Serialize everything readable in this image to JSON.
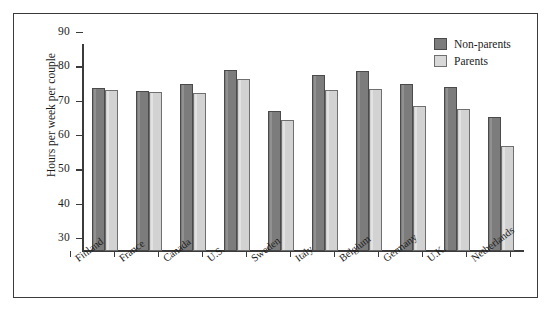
{
  "chart_data": {
    "type": "bar",
    "title": "",
    "xlabel": "",
    "ylabel": "Hours per week per couple",
    "ylim": [
      30,
      90
    ],
    "yticks": [
      90,
      80,
      70,
      60,
      50,
      40,
      30
    ],
    "grid": false,
    "legend_position": "top-right",
    "categories": [
      "Finland",
      "France",
      "Canada",
      "U.S.",
      "Sweden",
      "Italy",
      "Belgium",
      "Germany",
      "U.K.",
      "Netherlands"
    ],
    "series": [
      {
        "name": "Non-parents",
        "color": "#7c7c7c",
        "values": [
          77.5,
          76.7,
          78.5,
          82.8,
          70.8,
          81.4,
          82.3,
          78.7,
          77.7,
          69.0
        ]
      },
      {
        "name": "Parents",
        "color": "#d2d2d2",
        "values": [
          77.0,
          76.2,
          76.0,
          80.1,
          68.2,
          76.8,
          77.2,
          72.2,
          71.5,
          60.6
        ]
      }
    ]
  },
  "legend": {
    "items": [
      {
        "label": "Non-parents"
      },
      {
        "label": "Parents"
      }
    ]
  }
}
